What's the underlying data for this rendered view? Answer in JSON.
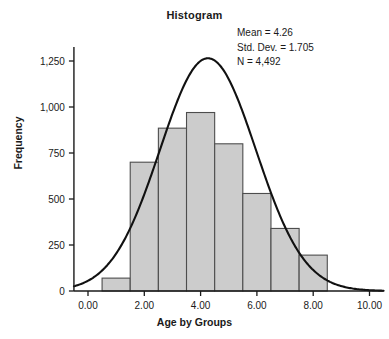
{
  "title": "Histogram",
  "stats": {
    "mean_label": "Mean = 4.26",
    "std_dev_label": "Std. Dev. = 1.705",
    "n_label": "N = 4,492"
  },
  "axes": {
    "x_title": "Age by Groups",
    "y_title": "Frequency",
    "x_ticks": [
      "0.00",
      "2.00",
      "4.00",
      "6.00",
      "8.00",
      "10.00"
    ],
    "y_ticks": [
      "0",
      "250",
      "500",
      "750",
      "1,000",
      "1,250"
    ]
  },
  "colors": {
    "bar_fill": "#cccccc",
    "bar_stroke": "#4d4d4d",
    "curve": "#111111",
    "axis": "#1a1a1a",
    "text": "#1a1a1a",
    "background": "#ffffff"
  },
  "chart_data": {
    "type": "bar",
    "title": "Histogram",
    "xlabel": "Age by Groups",
    "ylabel": "Frequency",
    "xlim": [
      -0.5,
      10.5
    ],
    "ylim": [
      0,
      1330
    ],
    "grid": false,
    "legend": false,
    "x_tick_values": [
      0,
      2,
      4,
      6,
      8,
      10
    ],
    "y_tick_values": [
      0,
      250,
      500,
      750,
      1000,
      1250
    ],
    "bin_width": 1,
    "bin_edges": [
      0.5,
      1.5,
      2.5,
      3.5,
      4.5,
      5.5,
      6.5,
      7.5,
      8.5
    ],
    "bin_centers": [
      1,
      2,
      3,
      4,
      5,
      6,
      7,
      8
    ],
    "values": [
      70,
      700,
      885,
      970,
      800,
      530,
      340,
      195
    ],
    "categories": [
      "0.5-1.5",
      "1.5-2.5",
      "2.5-3.5",
      "3.5-4.5",
      "4.5-5.5",
      "5.5-6.5",
      "6.5-7.5",
      "7.5-8.5"
    ],
    "overlay": {
      "type": "normal-curve",
      "mean": 4.26,
      "std_dev": 1.705,
      "n": 4492,
      "peak_value": 1265,
      "peak_x": 4.0
    },
    "annotations": [
      "Mean = 4.26",
      "Std. Dev. = 1.705",
      "N = 4,492"
    ]
  }
}
